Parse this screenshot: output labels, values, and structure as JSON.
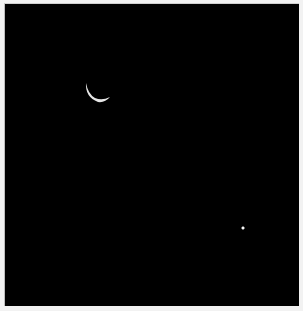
{
  "image": {
    "description": "Night sky photograph with a thin crescent moon and a single bright point (planet/star)",
    "background_color": "#000000",
    "frame_color": "#f2f2f2"
  },
  "scene": {
    "moon": {
      "type": "crescent",
      "color": "#e8e8e8",
      "center_x": 97,
      "center_y": 88,
      "radius": 13,
      "orientation": "lit-lower-left"
    },
    "star": {
      "color": "#f0f0f0",
      "x": 242,
      "y": 227,
      "radius": 1.2
    }
  }
}
